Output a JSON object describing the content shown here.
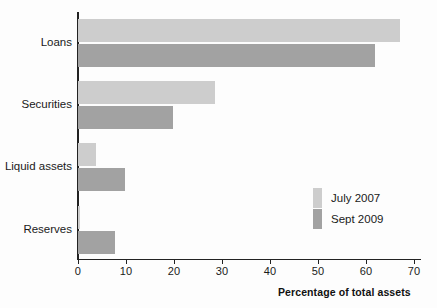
{
  "chart_data": {
    "type": "bar",
    "orientation": "horizontal",
    "title": "",
    "subtitle": "",
    "xlabel": "Percentage of total assets",
    "ylabel": "",
    "categories": [
      "Loans",
      "Securities",
      "Liquid assets",
      "Reserves"
    ],
    "series": [
      {
        "name": "July 2007",
        "color": "#cdcdcd",
        "values": [
          67.0,
          28.5,
          3.8,
          0.5
        ]
      },
      {
        "name": "Sept 2009",
        "color": "#a2a2a2",
        "values": [
          61.8,
          19.8,
          9.8,
          7.7
        ]
      }
    ],
    "xlim": [
      0,
      73
    ],
    "xticks": [
      0,
      10,
      20,
      30,
      40,
      50,
      60,
      70
    ],
    "xtick_labels": [
      "0",
      "10",
      "20",
      "30",
      "40",
      "50",
      "60",
      "70"
    ],
    "grid": false,
    "legend_position": "middle-right",
    "axis_color": "#222222"
  }
}
